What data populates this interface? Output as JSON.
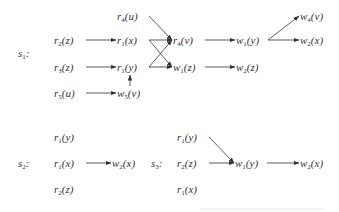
{
  "diagram": {
    "s1": {
      "label": {
        "base": "s",
        "sub": "1",
        "suffix": ":"
      },
      "nodes": {
        "r4u": {
          "base": "r",
          "sub": "4",
          "arg": "(u)"
        },
        "r2z": {
          "base": "r",
          "sub": "2",
          "arg": "(z)"
        },
        "r1x": {
          "base": "r",
          "sub": "1",
          "arg": "(x)"
        },
        "r4v": {
          "base": "r",
          "sub": "4",
          "arg": "(v)"
        },
        "w1y": {
          "base": "w",
          "sub": "1",
          "arg": "(y)"
        },
        "w4v": {
          "base": "w",
          "sub": "4",
          "arg": "(v)"
        },
        "w2x": {
          "base": "w",
          "sub": "2",
          "arg": "(x)"
        },
        "r3z": {
          "base": "r",
          "sub": "3",
          "arg": "(z)"
        },
        "r1y": {
          "base": "r",
          "sub": "1",
          "arg": "(y)"
        },
        "w1z": {
          "base": "w",
          "sub": "1",
          "arg": "(z)"
        },
        "w2z": {
          "base": "w",
          "sub": "2",
          "arg": "(z)"
        },
        "r5u": {
          "base": "r",
          "sub": "5",
          "arg": "(u)"
        },
        "w5v": {
          "base": "w",
          "sub": "5",
          "arg": "(v)"
        }
      },
      "edges": [
        [
          "r2z",
          "r1x"
        ],
        [
          "r3z",
          "r1y"
        ],
        [
          "r5u",
          "w5v"
        ],
        [
          "w5v",
          "r1y"
        ],
        [
          "r4u",
          "r4v"
        ],
        [
          "r1x",
          "r4v"
        ],
        [
          "r1x",
          "w1z"
        ],
        [
          "r1y",
          "r4v"
        ],
        [
          "r1y",
          "w1z"
        ],
        [
          "r4v",
          "w1y"
        ],
        [
          "w1y",
          "w4v"
        ],
        [
          "w1y",
          "w2x"
        ],
        [
          "w1z",
          "w2z"
        ]
      ]
    },
    "s2": {
      "label": {
        "base": "s",
        "sub": "2",
        "suffix": ":"
      },
      "nodes": {
        "r1y": {
          "base": "r",
          "sub": "1",
          "arg": "(y)"
        },
        "r1x": {
          "base": "r",
          "sub": "1",
          "arg": "(x)"
        },
        "w2x": {
          "base": "w",
          "sub": "2",
          "arg": "(x)"
        },
        "r2z": {
          "base": "r",
          "sub": "2",
          "arg": "(z)"
        }
      },
      "edges": [
        [
          "r1x",
          "w2x"
        ]
      ]
    },
    "s3": {
      "label": {
        "base": "s",
        "sub": "3",
        "suffix": ":"
      },
      "nodes": {
        "r1y": {
          "base": "r",
          "sub": "1",
          "arg": "(y)"
        },
        "r2z": {
          "base": "r",
          "sub": "2",
          "arg": "(z)"
        },
        "w1y": {
          "base": "w",
          "sub": "1",
          "arg": "(y)"
        },
        "w2x": {
          "base": "w",
          "sub": "2",
          "arg": "(x)"
        },
        "r1x": {
          "base": "r",
          "sub": "1",
          "arg": "(x)"
        }
      },
      "edges": [
        [
          "r1y",
          "w1y"
        ],
        [
          "r2z",
          "w1y"
        ],
        [
          "w1y",
          "w2x"
        ]
      ]
    }
  }
}
